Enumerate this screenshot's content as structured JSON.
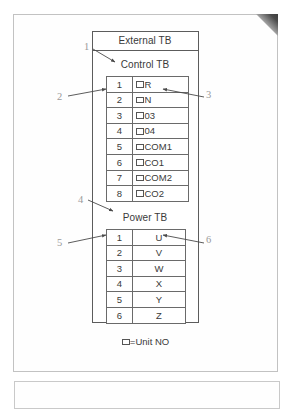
{
  "diagram": {
    "external_tb_label": "External TB",
    "control_tb_title": "Control TB",
    "power_tb_title": "Power TB",
    "legend_text": "=Unit NO",
    "unit_box_icon": "unit-no-box-icon",
    "control_tb": {
      "rows": [
        {
          "no": "1",
          "label": "R",
          "has_box": true
        },
        {
          "no": "2",
          "label": "N",
          "has_box": true
        },
        {
          "no": "3",
          "label": "03",
          "has_box": true
        },
        {
          "no": "4",
          "label": "04",
          "has_box": true
        },
        {
          "no": "5",
          "label": "COM1",
          "has_box": true
        },
        {
          "no": "6",
          "label": "CO1",
          "has_box": true
        },
        {
          "no": "7",
          "label": "COM2",
          "has_box": true
        },
        {
          "no": "8",
          "label": "CO2",
          "has_box": true
        }
      ]
    },
    "power_tb": {
      "rows": [
        {
          "no": "1",
          "label": "U"
        },
        {
          "no": "2",
          "label": "V"
        },
        {
          "no": "3",
          "label": "W"
        },
        {
          "no": "4",
          "label": "X"
        },
        {
          "no": "5",
          "label": "Y"
        },
        {
          "no": "6",
          "label": "Z"
        }
      ]
    },
    "callouts": [
      {
        "id": "1",
        "number": "1",
        "points_to": "external-tb-box"
      },
      {
        "id": "2",
        "number": "2",
        "points_to": "control-tb-terminal-number"
      },
      {
        "id": "3",
        "number": "3",
        "points_to": "control-tb-terminal-label"
      },
      {
        "id": "4",
        "number": "4",
        "points_to": "power-tb-title"
      },
      {
        "id": "5",
        "number": "5",
        "points_to": "power-tb-terminal-number"
      },
      {
        "id": "6",
        "number": "6",
        "points_to": "power-tb-terminal-label"
      }
    ]
  },
  "colors": {
    "line": "#5c5c5c",
    "table_line": "#6a6a6a",
    "text": "#3a3a3a",
    "callout": "#9a9a9a",
    "page_border": "#c2c2c2"
  }
}
